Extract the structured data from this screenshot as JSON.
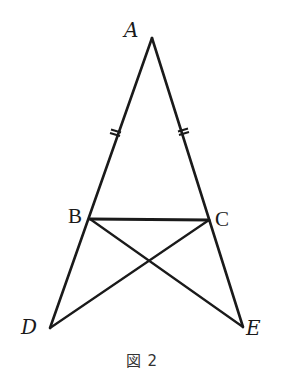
{
  "figure": {
    "caption": "図 2",
    "stroke_color": "#1a1a1a",
    "background": "#ffffff",
    "points": {
      "A": {
        "label": "A",
        "x": 152,
        "y": 38
      },
      "B": {
        "label": "B",
        "x": 90,
        "y": 219
      },
      "C": {
        "label": "C",
        "x": 209,
        "y": 220
      },
      "D": {
        "label": "D",
        "x": 50,
        "y": 328
      },
      "E": {
        "label": "E",
        "x": 243,
        "y": 327
      }
    },
    "segments": [
      [
        "A",
        "D"
      ],
      [
        "A",
        "E"
      ],
      [
        "B",
        "C"
      ],
      [
        "B",
        "E"
      ],
      [
        "C",
        "D"
      ]
    ],
    "equal_marks": {
      "description": "AB = AC (double tick marks)",
      "on": [
        [
          "A",
          "B"
        ],
        [
          "A",
          "C"
        ]
      ]
    }
  }
}
